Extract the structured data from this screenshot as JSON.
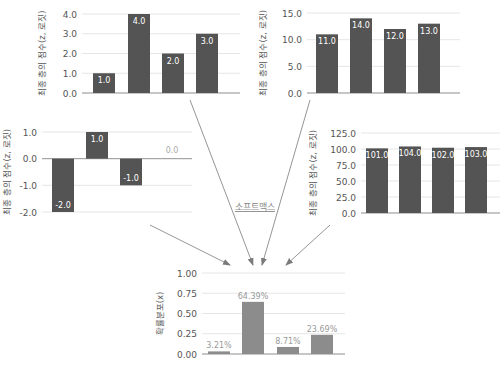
{
  "colors": {
    "bar": "#545454",
    "prob_bar": "#8c8c8c",
    "axis_text": "#555555",
    "grid": "#e6e6e6",
    "bar_label": "#ffffff",
    "prob_label": "#9a9a9a",
    "zero_label": "#aaaaaa",
    "arrow": "#7a7a7a",
    "softmax_label": "#888888"
  },
  "softmax_label": "소프트맥스",
  "chart_data": [
    {
      "id": "top-left",
      "type": "bar",
      "title": "",
      "xlabel": "",
      "ylabel": "최종 층의 점수(z, 로짓)",
      "categories": [
        "1",
        "2",
        "3",
        "4"
      ],
      "values": [
        1.0,
        4.0,
        2.0,
        3.0
      ],
      "labels": [
        "1.0",
        "4.0",
        "2.0",
        "3.0"
      ],
      "ylim": [
        0,
        4
      ],
      "yticks": [
        "0.0",
        "1.0",
        "2.0",
        "3.0",
        "4.0"
      ],
      "grid": true
    },
    {
      "id": "top-right",
      "type": "bar",
      "title": "",
      "xlabel": "",
      "ylabel": "최종 층의 점수(z, 로짓)",
      "categories": [
        "1",
        "2",
        "3",
        "4"
      ],
      "values": [
        11.0,
        14.0,
        12.0,
        13.0
      ],
      "labels": [
        "11.0",
        "14.0",
        "12.0",
        "13.0"
      ],
      "ylim": [
        0,
        15
      ],
      "yticks": [
        "0.0",
        "5.0",
        "10.0",
        "15.0"
      ],
      "grid": true
    },
    {
      "id": "middle-left",
      "type": "bar",
      "title": "",
      "xlabel": "",
      "ylabel": "최종 층의 점수(z, 로짓)",
      "categories": [
        "1",
        "2",
        "3",
        "4"
      ],
      "values": [
        -2.0,
        1.0,
        -1.0,
        0.0
      ],
      "labels": [
        "-2.0",
        "1.0",
        "-1.0",
        "0.0"
      ],
      "ylim": [
        -2,
        1
      ],
      "yticks": [
        "-2.0",
        "-1.0",
        "0.0",
        "1.0"
      ],
      "grid": true
    },
    {
      "id": "middle-right",
      "type": "bar",
      "title": "",
      "xlabel": "",
      "ylabel": "최종 층의 점수(z, 로짓)",
      "categories": [
        "1",
        "2",
        "3",
        "4"
      ],
      "values": [
        101.0,
        104.0,
        102.0,
        103.0
      ],
      "labels": [
        "101.0",
        "104.0",
        "102.0",
        "103.0"
      ],
      "ylim": [
        0,
        125
      ],
      "yticks": [
        "0.0",
        "25.0",
        "50.0",
        "75.0",
        "100.0",
        "125.0"
      ],
      "grid": true
    },
    {
      "id": "bottom",
      "type": "bar",
      "title": "",
      "xlabel": "",
      "ylabel": "확률분포(x)",
      "categories": [
        "1",
        "2",
        "3",
        "4"
      ],
      "values": [
        0.0321,
        0.6439,
        0.0871,
        0.2369
      ],
      "labels": [
        "3.21%",
        "64.39%",
        "8.71%",
        "23.69%"
      ],
      "ylim": [
        0,
        1
      ],
      "yticks": [
        "0.00",
        "0.25",
        "0.50",
        "0.75",
        "1.00"
      ],
      "grid": true
    }
  ]
}
